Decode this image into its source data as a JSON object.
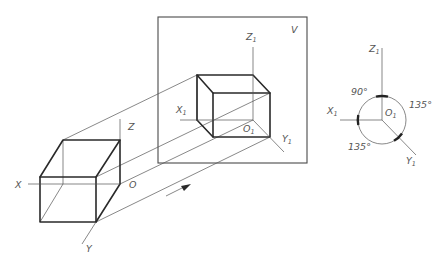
{
  "diagram": {
    "type": "orthographic-projection",
    "plane_label": "V",
    "space_axes": {
      "x": "X",
      "y": "Y",
      "z": "Z",
      "origin": "O"
    },
    "projected_axes": {
      "x": "X",
      "x_sub": "1",
      "y": "Y",
      "y_sub": "1",
      "z": "Z",
      "z_sub": "1",
      "origin": "O",
      "origin_sub": "1"
    },
    "axis_diagram": {
      "angles": [
        {
          "label": "90°",
          "between": "X1-Z1"
        },
        {
          "label": "135°",
          "between": "Z1-Y1"
        },
        {
          "label": "135°",
          "between": "X1-Y1"
        }
      ],
      "axes": {
        "x": "X",
        "x_sub": "1",
        "y": "Y",
        "y_sub": "1",
        "z": "Z",
        "z_sub": "1",
        "origin": "O",
        "origin_sub": "1"
      }
    },
    "projection_direction": "arrow pointing toward V plane"
  }
}
